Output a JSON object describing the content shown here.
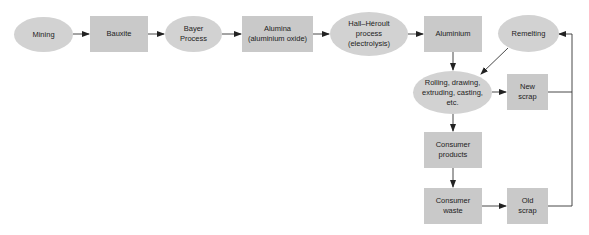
{
  "diagram": {
    "colors": {
      "rect_fill": "#c9c9c9",
      "ellipse_fill": "#d2d2d2",
      "line": "#333333",
      "text": "#222222"
    },
    "nodes": {
      "mining": {
        "label": "Mining",
        "shape": "ellipse"
      },
      "bauxite": {
        "label": "Bauxite",
        "shape": "rect"
      },
      "bayer": {
        "label": "Bayer\nProcess",
        "shape": "ellipse"
      },
      "alumina": {
        "label": "Alumina\n(aluminium oxide)",
        "shape": "rect"
      },
      "hall": {
        "label": "Hall–Héroult\nprocess\n(electrolysis)",
        "shape": "ellipse"
      },
      "aluminium": {
        "label": "Aluminium",
        "shape": "rect"
      },
      "remelting": {
        "label": "Remelting",
        "shape": "ellipse"
      },
      "rolling": {
        "label": "Rolling, drawing,\nextruding, casting,\netc.",
        "shape": "ellipse"
      },
      "new_scrap": {
        "label": "New\nscrap",
        "shape": "rect"
      },
      "consumer_products": {
        "label": "Consumer\nproducts",
        "shape": "rect"
      },
      "consumer_waste": {
        "label": "Consumer\nwaste",
        "shape": "rect"
      },
      "old_scrap": {
        "label": "Old\nscrap",
        "shape": "rect"
      }
    },
    "edges": [
      [
        "Mining",
        "Bauxite"
      ],
      [
        "Bauxite",
        "Bayer Process"
      ],
      [
        "Bayer Process",
        "Alumina (aluminium oxide)"
      ],
      [
        "Alumina (aluminium oxide)",
        "Hall–Héroult process (electrolysis)"
      ],
      [
        "Hall–Héroult process (electrolysis)",
        "Aluminium"
      ],
      [
        "Aluminium",
        "Rolling, drawing, extruding, casting, etc."
      ],
      [
        "Remelting",
        "Rolling, drawing, extruding, casting, etc."
      ],
      [
        "Rolling, drawing, extruding, casting, etc.",
        "New scrap"
      ],
      [
        "Rolling, drawing, extruding, casting, etc.",
        "Consumer products"
      ],
      [
        "Consumer products",
        "Consumer waste"
      ],
      [
        "Consumer waste",
        "Old scrap"
      ],
      [
        "New scrap",
        "Remelting"
      ],
      [
        "Old scrap",
        "Remelting"
      ]
    ]
  }
}
